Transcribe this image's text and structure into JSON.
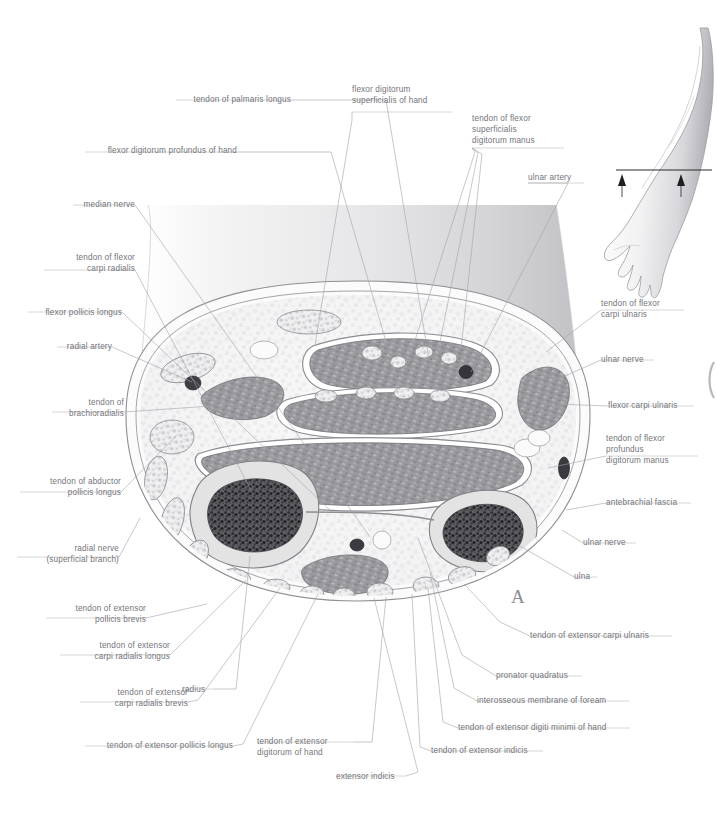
{
  "figure": {
    "panel_letter": "A",
    "title_visible": false,
    "ink_color": "#74747a",
    "leader_color": "#9a9aa0",
    "background": "#ffffff"
  },
  "orientation_inset": {
    "name": "arm-orientation-diagram",
    "section_line": true,
    "arrow_count": 2
  },
  "labels_top": [
    {
      "id": "tendon-of-palmaris-longus",
      "lines": [
        "tendon of palmaris longus"
      ],
      "align": "right",
      "x": 176,
      "y": 94,
      "w": 115
    },
    {
      "id": "flexor-digitorum-superficialis-of-hand",
      "lines": [
        "flexor digitorum",
        "superficialis of hand"
      ],
      "align": "left",
      "x": 352,
      "y": 84,
      "w": 100
    },
    {
      "id": "tendon-of-flexor-superficialis-digitorum-manus",
      "lines": [
        "tendon of flexor",
        "superficialis",
        "digitorum manus"
      ],
      "align": "left",
      "x": 472,
      "y": 113,
      "w": 92
    },
    {
      "id": "flexor-digitorum-profundus-of-hand",
      "lines": [
        "flexor digitorum profundus of hand"
      ],
      "align": "right",
      "x": 85,
      "y": 145,
      "w": 152
    },
    {
      "id": "ulnar-artery",
      "lines": [
        "ulnar artery"
      ],
      "align": "left",
      "x": 528,
      "y": 172,
      "w": 56
    }
  ],
  "labels_left": [
    {
      "id": "median-nerve",
      "lines": [
        "median nerve"
      ],
      "x": 73,
      "y": 199,
      "w": 62
    },
    {
      "id": "tendon-of-flexor-carpi-radialis",
      "lines": [
        "tendon of flexor",
        "carpi radialis"
      ],
      "x": 44,
      "y": 252,
      "w": 91
    },
    {
      "id": "flexor-pollicis-longus",
      "lines": [
        "flexor pollicis longus"
      ],
      "x": 28,
      "y": 307,
      "w": 94
    },
    {
      "id": "radial-artery",
      "lines": [
        "radial artery"
      ],
      "x": 57,
      "y": 341,
      "w": 55
    },
    {
      "id": "tendon-of-brachioradialis",
      "lines": [
        "tendon of",
        "brachioradialis"
      ],
      "x": 52,
      "y": 397,
      "w": 72
    },
    {
      "id": "tendon-of-abductor-pollicis-longus",
      "lines": [
        "tendon of abductor",
        "pollicis longus"
      ],
      "x": 20,
      "y": 476,
      "w": 101
    },
    {
      "id": "radial-nerve-superficial-branch",
      "lines": [
        "radial nerve",
        "(superficial branch)"
      ],
      "x": 17,
      "y": 543,
      "w": 102
    },
    {
      "id": "tendon-of-extensor-pollicis-brevis",
      "lines": [
        "tendon of extensor",
        "pollicis brevis"
      ],
      "x": 46,
      "y": 603,
      "w": 100
    },
    {
      "id": "tendon-of-extensor-carpi-radialis-longus",
      "lines": [
        "tendon of extensor",
        "carpi radialis longus"
      ],
      "x": 60,
      "y": 640,
      "w": 110
    },
    {
      "id": "tendon-of-extensor-carpi-radialis-brevis",
      "lines": [
        "tendon of extensor",
        "carpi radialis brevis"
      ],
      "x": 80,
      "y": 687,
      "w": 108
    }
  ],
  "labels_bottom": [
    {
      "id": "radius",
      "lines": [
        "radius"
      ],
      "align": "left",
      "x": 182,
      "y": 684,
      "w": 32
    },
    {
      "id": "tendon-of-extensor-pollicis-longus",
      "lines": [
        "tendon of extensor pollicis longus"
      ],
      "align": "right",
      "x": 85,
      "y": 740,
      "w": 148
    },
    {
      "id": "tendon-of-extensor-digitorum-of-hand",
      "lines": [
        "tendon of extensor",
        "digitorum of hand"
      ],
      "align": "left",
      "x": 257,
      "y": 736,
      "w": 97
    },
    {
      "id": "extensor-indicis",
      "lines": [
        "extensor indicis"
      ],
      "align": "left",
      "x": 336,
      "y": 771,
      "w": 70
    },
    {
      "id": "tendon-of-extensor-indicis",
      "lines": [
        "tendon of extensor indicis"
      ],
      "align": "left",
      "x": 431,
      "y": 745,
      "w": 112
    },
    {
      "id": "tendon-of-extensor-digiti-minimi-of-hand",
      "lines": [
        "tendon of extensor digiti minimi of hand"
      ],
      "align": "left",
      "x": 458,
      "y": 722,
      "w": 172
    },
    {
      "id": "interosseous-membrane-of-foream",
      "lines": [
        "interosseous membrane of foream"
      ],
      "align": "left",
      "x": 477,
      "y": 695,
      "w": 152
    },
    {
      "id": "pronator-quadratus",
      "lines": [
        "pronator quadratus"
      ],
      "align": "left",
      "x": 496,
      "y": 670,
      "w": 86
    },
    {
      "id": "tendon-of-extensor-carpi-ulnaris",
      "lines": [
        "tendon of extensor carpi ulnaris"
      ],
      "align": "left",
      "x": 530,
      "y": 630,
      "w": 142
    }
  ],
  "labels_right": [
    {
      "id": "tendon-of-flexor-carpi-ulnaris",
      "lines": [
        "tendon of flexor",
        "carpi ulnaris"
      ],
      "x": 601,
      "y": 298,
      "w": 83
    },
    {
      "id": "ulnar-nerve-upper",
      "lines": [
        "ulnar nerve"
      ],
      "x": 601,
      "y": 354,
      "w": 53
    },
    {
      "id": "flexor-carpi-ulnaris",
      "lines": [
        "flexor carpi ulnaris"
      ],
      "x": 608,
      "y": 400,
      "w": 86
    },
    {
      "id": "tendon-of-flexor-profundus-digitorum-manus",
      "lines": [
        "tendon of flexor",
        "profundus",
        "digitorum manus"
      ],
      "x": 606,
      "y": 433,
      "w": 92
    },
    {
      "id": "antebrachial-fascia",
      "lines": [
        "antebrachial fascia"
      ],
      "x": 606,
      "y": 497,
      "w": 85
    },
    {
      "id": "ulnar-nerve-lower",
      "lines": [
        "ulnar nerve"
      ],
      "x": 583,
      "y": 537,
      "w": 53
    },
    {
      "id": "ulna",
      "lines": [
        "ulna"
      ],
      "x": 574,
      "y": 571,
      "w": 23
    }
  ]
}
